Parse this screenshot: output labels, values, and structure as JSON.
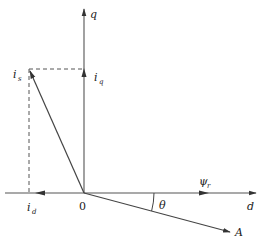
{
  "diagram": {
    "type": "vector-phasor-diagram",
    "colors": {
      "line": "#555555",
      "text": "#222222",
      "background": "#ffffff"
    },
    "axes": {
      "d": {
        "label": "d"
      },
      "q": {
        "label": "q"
      },
      "origin": {
        "label": "0"
      }
    },
    "vectors": {
      "is": {
        "label_main": "i",
        "label_sub": "s"
      },
      "iq": {
        "label_main": "i",
        "label_sub": "q"
      },
      "id": {
        "label_main": "i",
        "label_sub": "d"
      },
      "psi_r": {
        "label_main": "ψ",
        "label_sub": "r"
      },
      "A": {
        "label": "A"
      }
    },
    "angle": {
      "label": "θ"
    }
  }
}
